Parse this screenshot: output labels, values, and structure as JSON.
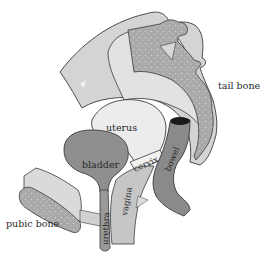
{
  "diagram": {
    "labels": {
      "tail_bone": "tail bone",
      "uterus": "uterus",
      "bladder": "bladder",
      "cervix": "cervix",
      "bowel": "bowel",
      "vagina": "vagina",
      "urethra": "urethra",
      "pubic_bone": "pubic bone"
    },
    "colors": {
      "background": "#ffffff",
      "pelvis_light": "#d4d4d4",
      "pelvis_inner": "#e2e2e2",
      "bone_speckle": "#a9a9a9",
      "uterus": "#ececec",
      "bladder": "#8f8f8f",
      "bowel": "#8a8a8a",
      "vagina": "#c6c6c6",
      "urethra": "#9a9a9a",
      "outline": "#3a3a3a"
    }
  }
}
